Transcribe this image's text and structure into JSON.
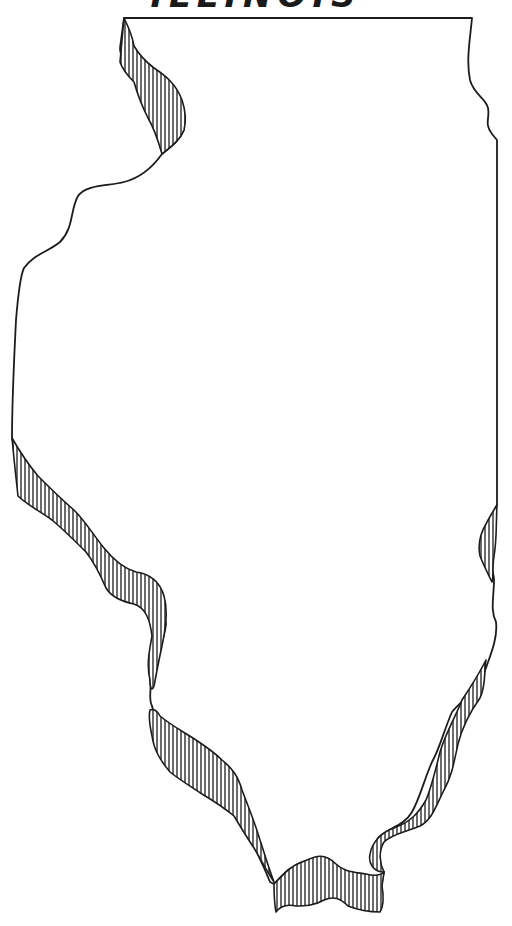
{
  "map": {
    "title": "ILLINOIS",
    "subject": "outline map of Illinois state",
    "style": "black ink line drawing with vertically hatched river borders",
    "features": [
      {
        "name": "mississippi-river-north",
        "location": "northwest border"
      },
      {
        "name": "mississippi-river-central",
        "location": "west border"
      },
      {
        "name": "mississippi-river-south",
        "location": "southwest border"
      },
      {
        "name": "ohio-river",
        "location": "southern tip"
      },
      {
        "name": "wabash-river",
        "location": "southeast border"
      }
    ],
    "colors": {
      "ink": "#1c1c1c",
      "paper": "#ffffff"
    }
  }
}
